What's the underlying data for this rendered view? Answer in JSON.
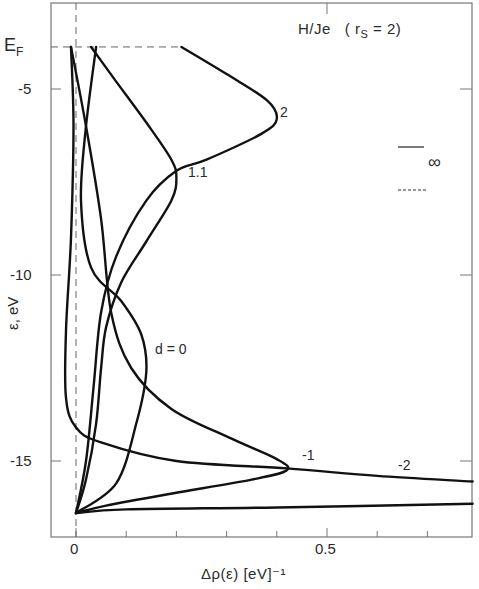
{
  "chart_data": {
    "type": "line",
    "title_main": "H/Je",
    "title_param": "( r",
    "title_sub": "S",
    "title_rest": " = 2)",
    "xlabel": "Δρ(ε) [eV]⁻¹",
    "ylabel": "ε, eV",
    "xlim": [
      -0.05,
      0.79
    ],
    "ylim": [
      -17.0,
      -2.6
    ],
    "x_ticks": [
      0,
      0.1,
      0.2,
      0.3,
      0.4,
      0.5,
      0.6,
      0.7
    ],
    "x_tick_labels": [
      {
        "value": 0,
        "label": "0"
      },
      {
        "value": 0.5,
        "label": "0.5"
      }
    ],
    "y_ticks": [
      -5,
      -10,
      -15
    ],
    "y_tick_labels": [
      {
        "value": -5,
        "label": "-5"
      },
      {
        "value": -10,
        "label": "-10"
      },
      {
        "value": -15,
        "label": "-15"
      }
    ],
    "fermi_level": {
      "label": "E",
      "sub": "F",
      "value": -3.87
    },
    "grid": false,
    "legend": {
      "position": "right",
      "entries": [
        {
          "style": "solid",
          "label": ""
        },
        {
          "style": "dashed",
          "label": "∞"
        }
      ]
    },
    "series": [
      {
        "name": "d = 2",
        "label": "2",
        "points": [
          [
            0.21,
            -3.87
          ],
          [
            0.3,
            -4.6
          ],
          [
            0.38,
            -5.3
          ],
          [
            0.4,
            -5.8
          ],
          [
            0.37,
            -6.2
          ],
          [
            0.26,
            -6.9
          ],
          [
            0.2,
            -7.2
          ],
          [
            0.14,
            -8.0
          ],
          [
            0.08,
            -9.5
          ],
          [
            0.05,
            -11.0
          ],
          [
            0.035,
            -13.0
          ],
          [
            0.02,
            -15.0
          ],
          [
            0.0,
            -16.4
          ]
        ]
      },
      {
        "name": "d = 1.1",
        "label": "1.1",
        "points": [
          [
            0.03,
            -3.87
          ],
          [
            0.08,
            -4.8
          ],
          [
            0.14,
            -5.9
          ],
          [
            0.19,
            -6.9
          ],
          [
            0.2,
            -7.4
          ],
          [
            0.19,
            -8.0
          ],
          [
            0.14,
            -9.1
          ],
          [
            0.09,
            -10.2
          ],
          [
            0.06,
            -11.4
          ],
          [
            0.05,
            -12.5
          ],
          [
            0.04,
            -14.0
          ],
          [
            0.02,
            -15.5
          ],
          [
            0.0,
            -16.4
          ]
        ]
      },
      {
        "name": "d = 0",
        "label": "d = 0",
        "points": [
          [
            0.04,
            -3.87
          ],
          [
            0.02,
            -6.0
          ],
          [
            0.01,
            -8.0
          ],
          [
            0.03,
            -9.8
          ],
          [
            0.09,
            -10.7
          ],
          [
            0.13,
            -11.6
          ],
          [
            0.14,
            -12.6
          ],
          [
            0.12,
            -14.0
          ],
          [
            0.08,
            -15.6
          ],
          [
            0.0,
            -16.4
          ]
        ]
      },
      {
        "name": "d = -1",
        "label": "-1",
        "points": [
          [
            -0.01,
            -3.87
          ],
          [
            0.02,
            -6.0
          ],
          [
            0.05,
            -8.5
          ],
          [
            0.07,
            -11.0
          ],
          [
            0.11,
            -12.5
          ],
          [
            0.19,
            -13.6
          ],
          [
            0.31,
            -14.4
          ],
          [
            0.4,
            -14.95
          ],
          [
            0.42,
            -15.25
          ],
          [
            0.35,
            -15.5
          ],
          [
            0.18,
            -15.9
          ],
          [
            0.06,
            -16.2
          ],
          [
            0.0,
            -16.4
          ]
        ]
      },
      {
        "name": "d = -2",
        "label": "-2",
        "points": [
          [
            -0.01,
            -3.87
          ],
          [
            -0.005,
            -6.0
          ],
          [
            -0.01,
            -9.0
          ],
          [
            -0.02,
            -11.5
          ],
          [
            -0.02,
            -13.3
          ],
          [
            0.0,
            -14.1
          ],
          [
            0.05,
            -14.5
          ],
          [
            0.2,
            -15.0
          ],
          [
            0.42,
            -15.2
          ],
          [
            0.6,
            -15.4
          ],
          [
            0.79,
            -15.55
          ]
        ]
      },
      {
        "name": "d = ∞",
        "label": "",
        "points": [
          [
            0.0,
            -16.4
          ],
          [
            0.1,
            -16.3
          ],
          [
            0.4,
            -16.25
          ],
          [
            0.79,
            -16.15
          ]
        ]
      }
    ],
    "annotations": [
      {
        "text": "2",
        "x": 0.42,
        "y": -5.8
      },
      {
        "text": "1.1",
        "x": 0.22,
        "y": -7.4
      },
      {
        "text": "d = 0",
        "x": 0.16,
        "y": -12.3
      },
      {
        "text": "-1",
        "x": 0.45,
        "y": -14.9
      },
      {
        "text": "-2",
        "x": 0.65,
        "y": -15.15
      }
    ]
  }
}
